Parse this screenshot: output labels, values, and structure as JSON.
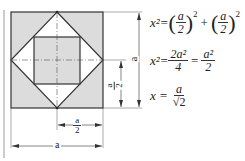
{
  "diagram": {
    "labels": {
      "outer_width": "a",
      "outer_height": "a",
      "half_width_num": "a",
      "half_width_den": "2",
      "half_height_num": "a",
      "half_height_den": "2"
    },
    "colors": {
      "shade": "#dcdcdc",
      "line": "#333333",
      "background": "#ffffff"
    }
  },
  "equations": {
    "eq1": {
      "lhs": "x²=",
      "t1_num": "a",
      "t1_den": "2",
      "exp": "2",
      "plus": "+",
      "t2_num": "a",
      "t2_den": "2"
    },
    "eq2": {
      "lhs": "x²=",
      "f1_num": "2a²",
      "f1_den": "4",
      "eq": "=",
      "f2_num": "a²",
      "f2_den": "2"
    },
    "eq3": {
      "lhs": "x =",
      "num": "a",
      "den": "√2"
    }
  }
}
